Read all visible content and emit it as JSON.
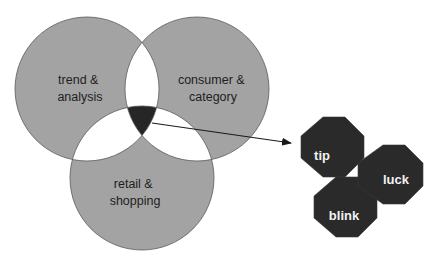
{
  "diagram": {
    "type": "venn-with-callout",
    "colors": {
      "circle_fill": "#a3a3a3",
      "circle_stroke": "#5a5a5a",
      "pair_overlap_fill": "#ffffff",
      "center_overlap_fill": "#262626",
      "octagon_fill": "#2a2a2a",
      "octagon_text": "#f2f2f2",
      "arrow": "#1a1a1a"
    },
    "circles": [
      {
        "id": "trend",
        "line1": "trend &",
        "line2": "analysis"
      },
      {
        "id": "consumer",
        "line1": "consumer &",
        "line2": "category"
      },
      {
        "id": "retail",
        "line1": "retail &",
        "line2": "shopping"
      }
    ],
    "octagons": [
      {
        "id": "tip",
        "label": "tip"
      },
      {
        "id": "luck",
        "label": "luck"
      },
      {
        "id": "blink",
        "label": "blink"
      }
    ]
  }
}
